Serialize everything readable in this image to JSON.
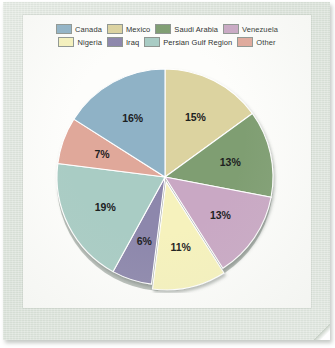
{
  "document": {
    "kind": "scanned-pie-chart",
    "frame_color": "#dde4dc",
    "card_color": "#fdfdfb"
  },
  "legend": {
    "rows": [
      [
        {
          "label": "Canada",
          "color": "#8fb2c6"
        },
        {
          "label": "Mexico",
          "color": "#dcd3a0"
        },
        {
          "label": "Saudi Arabia",
          "color": "#7f9e72"
        },
        {
          "label": "Venezuela",
          "color": "#c9a8c4"
        }
      ],
      [
        {
          "label": "Nigeria",
          "color": "#f6f2bd"
        },
        {
          "label": "Iraq",
          "color": "#8d87ac"
        },
        {
          "label": "Persian Gulf Region",
          "color": "#a9ccc4"
        },
        {
          "label": "Other",
          "color": "#e0a89a"
        }
      ]
    ]
  },
  "chart_data": {
    "type": "pie",
    "title": "",
    "subtitle": "",
    "xlabel": "",
    "ylabel": "",
    "legend_position": "top",
    "grid": false,
    "start_angle_deg": 0,
    "direction": "clockwise",
    "total": 100,
    "categories": [
      "Mexico",
      "Saudi Arabia",
      "Venezuela",
      "Nigeria",
      "Iraq",
      "Persian Gulf Region",
      "Other",
      "Canada"
    ],
    "values": [
      15,
      13,
      13,
      11,
      6,
      19,
      7,
      16
    ],
    "slices": [
      {
        "name": "Mexico",
        "value": 15,
        "label": "15%",
        "color": "#dcd3a0",
        "exploded": false
      },
      {
        "name": "Saudi Arabia",
        "value": 13,
        "label": "13%",
        "color": "#7f9e72",
        "exploded": false
      },
      {
        "name": "Venezuela",
        "value": 13,
        "label": "13%",
        "color": "#c9a8c4",
        "exploded": false
      },
      {
        "name": "Nigeria",
        "value": 11,
        "label": "11%",
        "color": "#f6f2bd",
        "exploded": true
      },
      {
        "name": "Iraq",
        "value": 6,
        "label": "6%",
        "color": "#8d87ac",
        "exploded": false
      },
      {
        "name": "Persian Gulf Region",
        "value": 19,
        "label": "19%",
        "color": "#a9ccc4",
        "exploded": false
      },
      {
        "name": "Other",
        "value": 7,
        "label": "7%",
        "color": "#e0a89a",
        "exploded": false
      },
      {
        "name": "Canada",
        "value": 16,
        "label": "16%",
        "color": "#8fb2c6",
        "exploded": false
      }
    ],
    "labels": [
      "15%",
      "13%",
      "13%",
      "11%",
      "6%",
      "19%",
      "7%",
      "16%"
    ]
  }
}
